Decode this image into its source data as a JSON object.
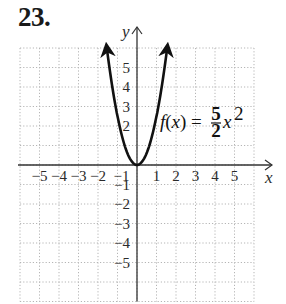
{
  "problem": {
    "number": "23."
  },
  "chart_data": {
    "type": "line",
    "title": "",
    "function_label": {
      "lhs": "f(x) = ",
      "numerator": "5",
      "denominator": "2",
      "var": "x",
      "exponent": "2"
    },
    "equation": "f(x) = (5/2)x^2",
    "xlabel": "x",
    "ylabel": "y",
    "xlim": [
      -6,
      6
    ],
    "ylim": [
      -7,
      6
    ],
    "grid": true,
    "x_ticks": [
      "-5",
      "-4",
      "-3",
      "-2",
      "-1",
      "1",
      "2",
      "3",
      "4",
      "5"
    ],
    "y_ticks": [
      "5",
      "4",
      "3",
      "2",
      "-1",
      "-2",
      "-3",
      "-4",
      "-5"
    ],
    "series": [
      {
        "name": "f(x) = 5/2 x^2",
        "x": [
          -1.55,
          -1.4,
          -1.2,
          -1,
          -0.8,
          -0.6,
          -0.4,
          -0.2,
          0,
          0.2,
          0.4,
          0.6,
          0.8,
          1,
          1.2,
          1.4,
          1.55
        ],
        "y": [
          6.0,
          4.9,
          3.6,
          2.5,
          1.6,
          0.9,
          0.4,
          0.1,
          0,
          0.1,
          0.4,
          0.9,
          1.6,
          2.5,
          3.6,
          4.9,
          6.0
        ]
      }
    ],
    "colors": {
      "curve": "#111111",
      "axis": "#333333",
      "grid": "#b5b5b5"
    }
  }
}
